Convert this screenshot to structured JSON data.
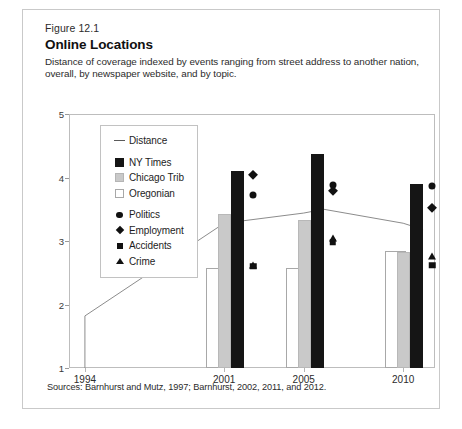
{
  "figure": {
    "number": "Figure 12.1",
    "title": "Online Locations",
    "subtitle": "Distance of coverage indexed by events ranging from street address to another nation, overall, by newspaper website, and by topic.",
    "sources": "Sources: Barnhurst and Mutz, 1997; Barnhurst, 2002, 2011, and 2012."
  },
  "legend": {
    "items": [
      {
        "label": "Distance",
        "key": "line-key",
        "group": "distance"
      },
      {
        "label": "NY Times",
        "key": "black-square-key",
        "group": "outlet"
      },
      {
        "label": "Chicago Trib",
        "key": "gray-square-key",
        "group": "outlet"
      },
      {
        "label": "Oregonian",
        "key": "white-square-key",
        "group": "outlet"
      },
      {
        "label": "Politics",
        "key": "circle-key",
        "group": "topic"
      },
      {
        "label": "Employment",
        "key": "diamond-key",
        "group": "topic"
      },
      {
        "label": "Accidents",
        "key": "square-key",
        "group": "topic"
      },
      {
        "label": "Crime",
        "key": "triangle-key",
        "group": "topic"
      }
    ]
  },
  "chart_data": {
    "type": "bar",
    "title": "Online Locations",
    "subtitle": "Distance of coverage indexed by events ranging from street address to another nation, overall, by newspaper website, and by topic.",
    "xlabel": "",
    "ylabel": "",
    "categories": [
      "1994",
      "2001",
      "2005",
      "2010"
    ],
    "ylim": [
      1,
      5
    ],
    "yticks": [
      1,
      2,
      3,
      4,
      5
    ],
    "grid": false,
    "legend_position": "inside-top-left",
    "series": [
      {
        "name": "Oregonian",
        "type": "bar",
        "marker": "white-square",
        "values": [
          null,
          2.57,
          2.57,
          2.85
        ]
      },
      {
        "name": "Chicago Trib",
        "type": "bar",
        "marker": "gray-square",
        "values": [
          null,
          3.42,
          3.33,
          2.82
        ]
      },
      {
        "name": "NY Times",
        "type": "bar",
        "marker": "black-square",
        "values": [
          null,
          4.1,
          4.37,
          3.9
        ]
      },
      {
        "name": "Politics",
        "type": "marker",
        "marker": "circle",
        "values": [
          null,
          3.73,
          3.88,
          3.86
        ]
      },
      {
        "name": "Employment",
        "type": "marker",
        "marker": "diamond",
        "values": [
          null,
          4.05,
          3.8,
          3.52
        ]
      },
      {
        "name": "Accidents",
        "type": "marker",
        "marker": "square",
        "values": [
          null,
          2.6,
          2.98,
          2.62
        ]
      },
      {
        "name": "Crime",
        "type": "marker",
        "marker": "triangle",
        "values": [
          null,
          2.63,
          3.05,
          2.77
        ]
      },
      {
        "name": "Distance",
        "type": "line",
        "marker": "line",
        "x": [
          1994,
          1994,
          2001,
          2005,
          2006,
          2010,
          2011
        ],
        "values": [
          1.0,
          1.82,
          3.28,
          3.44,
          3.5,
          3.28,
          3.18
        ]
      }
    ]
  },
  "axes": {
    "y_tick_labels": [
      "1",
      "2",
      "3",
      "4",
      "5"
    ],
    "x_tick_labels": [
      "1994",
      "2001",
      "2005",
      "2010"
    ]
  }
}
